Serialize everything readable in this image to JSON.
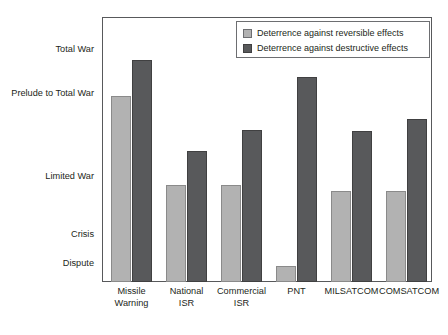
{
  "chart_data": {
    "type": "bar",
    "title": "",
    "xlabel": "",
    "ylabel": "",
    "grid": false,
    "legend_position": "top-right",
    "categories": [
      "Missile Warning",
      "National ISR",
      "Commercial ISR",
      "PNT",
      "MILSATCOM",
      "COMSATCOM"
    ],
    "category_lines": [
      [
        "Missile",
        "Warning"
      ],
      [
        "National",
        "ISR"
      ],
      [
        "Commercial",
        "ISR"
      ],
      [
        "PNT"
      ],
      [
        "MILSATCOM"
      ],
      [
        "COMSATCOM"
      ]
    ],
    "y_axis": {
      "type": "ordinal",
      "ticks": [
        "Dispute",
        "Crisis",
        "Limited War",
        "Prelude to Total War",
        "Total War"
      ],
      "tick_values": [
        1,
        2,
        3,
        4,
        5
      ],
      "ylim": [
        0,
        5.45
      ]
    },
    "series": [
      {
        "name": "Deterrence against reversible effects",
        "color": "#b2b2b2",
        "values": [
          3.83,
          1.99,
          1.99,
          0.32,
          1.88,
          1.88
        ]
      },
      {
        "name": "Deterrence against destructive effects",
        "color": "#58595b",
        "values": [
          4.56,
          2.7,
          3.13,
          4.21,
          3.11,
          3.35
        ]
      }
    ]
  },
  "axis_labels": {
    "total_war": "Total War",
    "prelude": "Prelude to Total War",
    "limited_war": "Limited War",
    "crisis": "Crisis",
    "dispute": "Dispute"
  },
  "legend": {
    "items": [
      {
        "label": "Deterrence against reversible effects",
        "color": "#b2b2b2",
        "key": "reversible"
      },
      {
        "label": "Deterrence against destructive effects",
        "color": "#58595b",
        "key": "destructive"
      }
    ]
  },
  "colors": {
    "reversible": "#b2b2b2",
    "destructive": "#58595b",
    "frame": "#58595b",
    "text": "#231f20",
    "background": "#ffffff"
  }
}
